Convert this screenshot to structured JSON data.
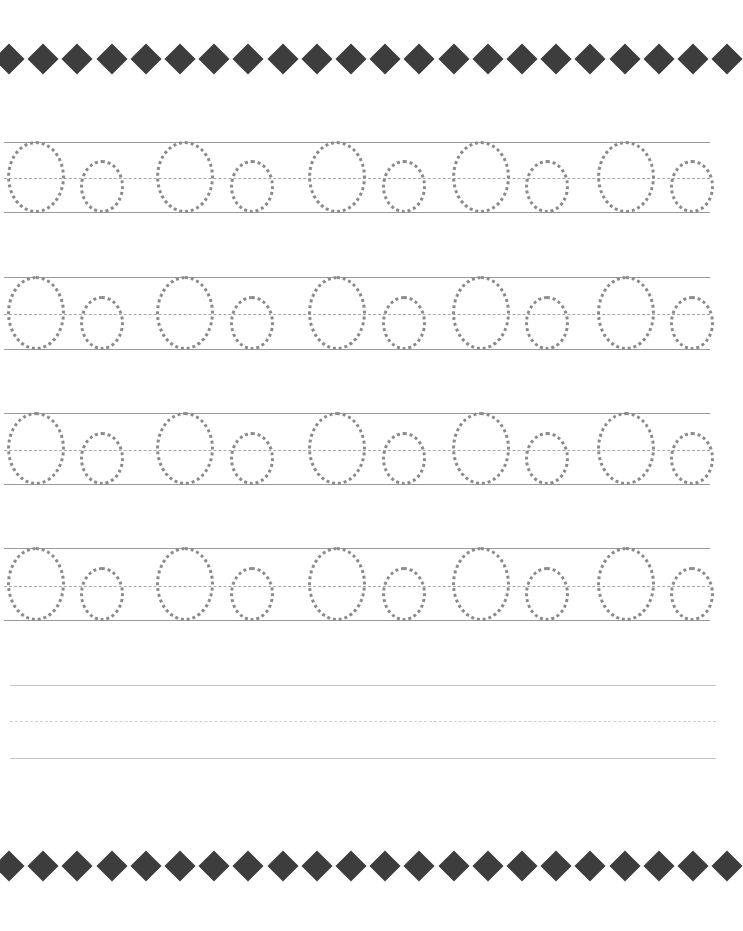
{
  "worksheet": {
    "type": "handwriting-tracing",
    "letters": [
      "O",
      "o"
    ],
    "colors": {
      "diamond": "#3d3d3d",
      "guide_line": "#9a9a9a",
      "dotted_letter": "#8a8a8a"
    },
    "borders": {
      "top_y": 59,
      "bottom_y": 866,
      "diamond_count": 22
    },
    "rows": [
      {
        "top": 142,
        "mid": 178,
        "bottom": 212,
        "tracing": true
      },
      {
        "top": 277,
        "mid": 314,
        "bottom": 349,
        "tracing": true
      },
      {
        "top": 413,
        "mid": 450,
        "bottom": 484,
        "tracing": true
      },
      {
        "top": 548,
        "mid": 586,
        "bottom": 620,
        "tracing": true
      },
      {
        "top": 685,
        "mid": 721,
        "bottom": 758,
        "tracing": false
      }
    ],
    "pairs_per_row": 5,
    "big_O_x": [
      36,
      185,
      337,
      481,
      626
    ],
    "small_o_x": [
      102,
      252,
      404,
      547,
      692
    ]
  }
}
